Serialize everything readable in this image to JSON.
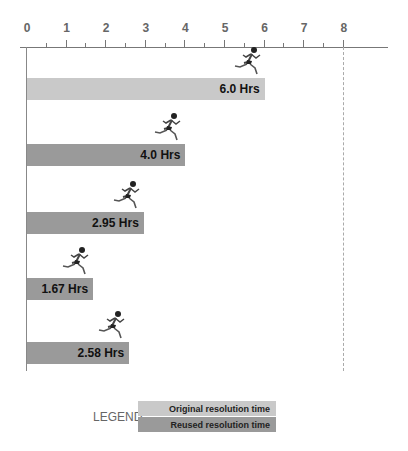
{
  "chart_data": {
    "type": "bar",
    "orientation": "horizontal",
    "title": "",
    "xlabel": "",
    "ylabel": "",
    "xlim": [
      0,
      8
    ],
    "x_ticks": [
      "0",
      "1",
      "2",
      "3",
      "4",
      "5",
      "6",
      "7",
      "8"
    ],
    "grid": false,
    "reference_line": {
      "x": 8,
      "style": "dashed"
    },
    "bars": [
      {
        "value": 6.0,
        "label": "6.0 Hrs",
        "series": "Original resolution time"
      },
      {
        "value": 4.0,
        "label": "4.0 Hrs",
        "series": "Reused resolution time"
      },
      {
        "value": 2.95,
        "label": "2.95 Hrs",
        "series": "Reused resolution time"
      },
      {
        "value": 1.67,
        "label": "1.67 Hrs",
        "series": "Reused resolution time"
      },
      {
        "value": 2.58,
        "label": "2.58 Hrs",
        "series": "Reused resolution time"
      }
    ],
    "series": [
      {
        "name": "Original resolution time",
        "color": "#c9c9c9",
        "values": [
          6.0
        ]
      },
      {
        "name": "Reused resolution time",
        "color": "#9a9a9a",
        "values": [
          4.0,
          2.95,
          1.67,
          2.58
        ]
      }
    ],
    "legend": {
      "title": "LEGEND",
      "position": "bottom",
      "entries": [
        "Original  resolution time",
        "Reused resolution time"
      ]
    },
    "decoration": "running-man icon at the end of each bar"
  }
}
